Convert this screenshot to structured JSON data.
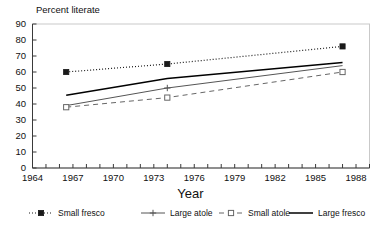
{
  "chart_data": {
    "type": "line",
    "title": "",
    "ylabel": "Percent literate",
    "xlabel": "Year",
    "xlim": [
      1964,
      1989
    ],
    "ylim": [
      0,
      90
    ],
    "xticks": [
      1964,
      1965,
      1966,
      1967,
      1968,
      1969,
      1970,
      1971,
      1972,
      1973,
      1974,
      1975,
      1976,
      1977,
      1978,
      1979,
      1980,
      1981,
      1982,
      1983,
      1984,
      1985,
      1986,
      1987,
      1988,
      1989
    ],
    "xtick_labels": [
      "1964",
      "1967",
      "1970",
      "1973",
      "1976",
      "1979",
      "1982",
      "1985",
      "1988"
    ],
    "xtick_label_values": [
      1964,
      1967,
      1970,
      1973,
      1976,
      1979,
      1982,
      1985,
      1988
    ],
    "yticks": [
      0,
      10,
      20,
      30,
      40,
      50,
      60,
      70,
      80,
      90
    ],
    "ytick_labels": [
      "0",
      "10",
      "20",
      "30",
      "40",
      "50",
      "60",
      "70",
      "80",
      "90"
    ],
    "grid": false,
    "legend_position": "bottom",
    "x": [
      1966.5,
      1974,
      1987
    ],
    "series": [
      {
        "name": "Small fresco",
        "values": [
          60,
          65,
          76
        ],
        "marker": "filled-square",
        "line_style": "dotted",
        "color": "#1a1a1a"
      },
      {
        "name": "Large atole",
        "values": [
          null,
          50,
          null
        ],
        "marker": "plus",
        "line_style": "solid-thin",
        "color": "#555555"
      },
      {
        "name": "Small atole",
        "values": [
          38,
          44,
          60
        ],
        "marker": "open-square",
        "line_style": "dashed",
        "color": "#666666"
      },
      {
        "name": "Large fresco",
        "values": [
          45.5,
          56,
          66
        ],
        "marker": "none",
        "line_style": "solid",
        "color": "#000000"
      }
    ]
  },
  "legend": {
    "items": [
      {
        "label": "Small fresco",
        "marker": "filled-square",
        "line_style": "dotted"
      },
      {
        "label": "Large atole",
        "marker": "plus",
        "line_style": "solid-thin"
      },
      {
        "label": "Small atole",
        "marker": "open-square",
        "line_style": "dashed"
      },
      {
        "label": "Large fresco",
        "marker": "none",
        "line_style": "solid"
      }
    ]
  }
}
